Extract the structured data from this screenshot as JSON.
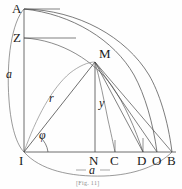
{
  "figure": {
    "caption": "[Fig. 11]",
    "stroke_color": "#4a4a4a",
    "label_color": "#1a1a1a",
    "background": "#fefefe",
    "points": {
      "A": {
        "label": "A",
        "x": 24,
        "y": 9
      },
      "Z": {
        "label": "Z",
        "x": 24,
        "y": 38
      },
      "M": {
        "label": "M",
        "x": 95,
        "y": 62
      },
      "I": {
        "label": "I",
        "x": 24,
        "y": 152
      },
      "N": {
        "label": "N",
        "x": 95,
        "y": 152
      },
      "C": {
        "label": "C",
        "x": 115,
        "y": 152
      },
      "D": {
        "label": "D",
        "x": 143,
        "y": 152
      },
      "O": {
        "label": "O",
        "x": 157,
        "y": 152
      },
      "B": {
        "label": "B",
        "x": 172,
        "y": 152
      }
    },
    "variables": {
      "radius_left": {
        "label": "a",
        "x": 9,
        "y": 74
      },
      "radius_vector": {
        "label": "r",
        "x": 52,
        "y": 98
      },
      "ordinate": {
        "label": "y",
        "x": 99,
        "y": 103
      },
      "angle": {
        "label": "φ",
        "x": 42,
        "y": 135
      },
      "base": {
        "label": "a",
        "x": 92,
        "y": 170
      }
    }
  }
}
